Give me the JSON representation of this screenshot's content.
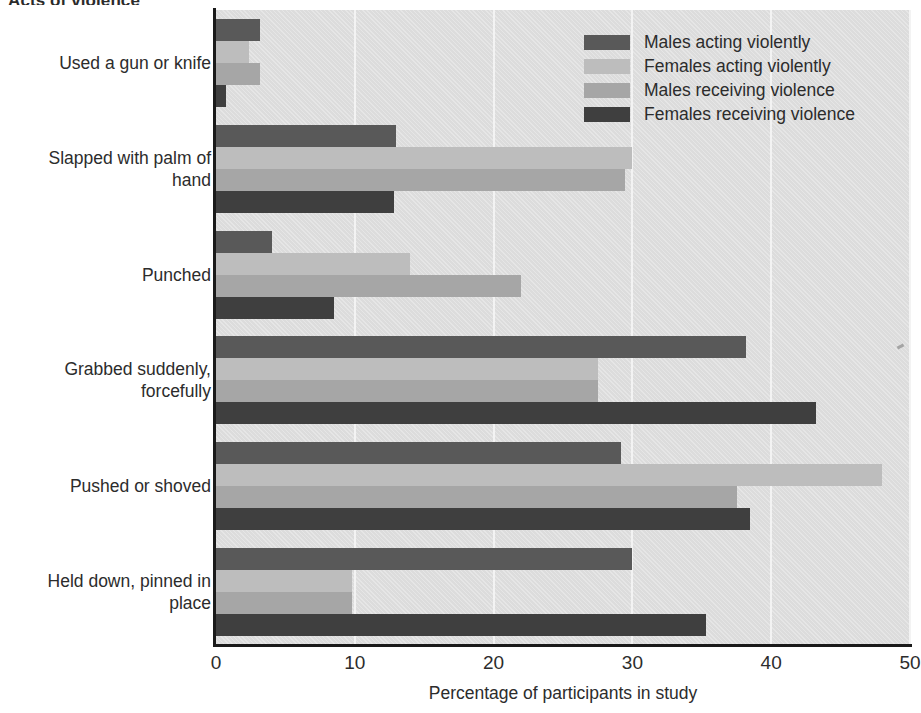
{
  "chart_data": {
    "type": "bar",
    "orientation": "horizontal",
    "title": "Acts of violence",
    "xlabel": "Percentage of participants in study",
    "ylabel": "",
    "xlim": [
      0,
      50
    ],
    "xticks": [
      0,
      10,
      20,
      30,
      40,
      50
    ],
    "grid": true,
    "legend_position": "top-right",
    "categories": [
      "Used a gun or knife",
      "Slapped with palm of\nhand",
      "Punched",
      "Grabbed suddenly,\nforcefully",
      "Pushed or shoved",
      "Held down, pinned in\nplace"
    ],
    "series": [
      {
        "name": "Males acting violently",
        "color": "#595959",
        "values": [
          3.2,
          13.0,
          4.0,
          38.2,
          29.2,
          30.0
        ]
      },
      {
        "name": "Females acting violently",
        "color": "#bdbdbd",
        "values": [
          2.4,
          30.0,
          14.0,
          27.5,
          48.0,
          9.8
        ]
      },
      {
        "name": "Males receiving violence",
        "color": "#a6a6a6",
        "values": [
          3.2,
          29.5,
          22.0,
          27.5,
          37.5,
          9.8
        ]
      },
      {
        "name": "Females receiving violence",
        "color": "#3f3f3f",
        "values": [
          0.7,
          12.8,
          8.5,
          43.2,
          38.5,
          35.3
        ]
      }
    ]
  },
  "legend": {
    "entries": [
      {
        "label": "Males acting violently",
        "color": "#595959"
      },
      {
        "label": "Females acting violently",
        "color": "#bdbdbd"
      },
      {
        "label": "Males receiving violence",
        "color": "#a6a6a6"
      },
      {
        "label": "Females receiving violence",
        "color": "#3f3f3f"
      }
    ]
  },
  "axis": {
    "x_title": "Percentage of participants in study",
    "x_tick_labels": [
      "0",
      "10",
      "20",
      "30",
      "40",
      "50"
    ]
  },
  "title": {
    "text": "Acts of violence"
  },
  "colors": {
    "plot_background": "#dcdcdc",
    "gridline": "#f3f3f3",
    "axis": "#1a1a1a",
    "text": "#2c2c2c"
  }
}
